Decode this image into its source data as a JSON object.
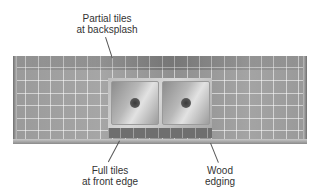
{
  "labels": {
    "backsplash": {
      "line1": "Partial tiles",
      "line2": "at backsplash"
    },
    "front_edge": {
      "line1": "Full tiles",
      "line2": "at front edge"
    },
    "wood_edging": {
      "line1": "Wood",
      "line2": "edging"
    }
  },
  "colors": {
    "tile": "#9a9a9a",
    "grout": "#d9d9d9",
    "sink": "#c4c4c4",
    "text": "#333333"
  }
}
